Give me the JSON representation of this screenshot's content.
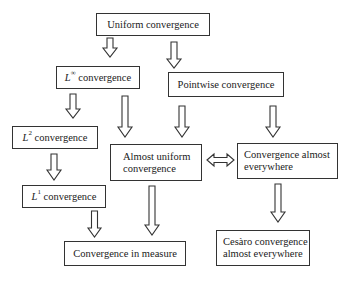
{
  "diagram": {
    "nodes": {
      "uniform": {
        "label": "Uniform convergence"
      },
      "linf": {
        "symbol": "L",
        "sup": "∞",
        "label": " convergence"
      },
      "pointwise": {
        "label": "Pointwise convergence"
      },
      "l2": {
        "symbol": "L",
        "sup": "2",
        "label": " convergence"
      },
      "almost_uniform": {
        "line1": "Almost uniform",
        "line2": "convergence"
      },
      "ae": {
        "line1": "Convergence almost",
        "line2": "everywhere"
      },
      "l1": {
        "symbol": "L",
        "sup": "1",
        "label": " convergence"
      },
      "measure": {
        "label": "Convergence in measure"
      },
      "cesaro": {
        "line1": "Cesàro convergence",
        "line2": "almost everywhere"
      }
    },
    "edges": [
      {
        "from": "uniform",
        "to": "linf",
        "type": "implies"
      },
      {
        "from": "uniform",
        "to": "pointwise",
        "type": "implies"
      },
      {
        "from": "linf",
        "to": "l2",
        "type": "implies"
      },
      {
        "from": "linf",
        "to": "almost_uniform",
        "type": "implies"
      },
      {
        "from": "pointwise",
        "to": "almost_uniform",
        "type": "implies"
      },
      {
        "from": "pointwise",
        "to": "ae",
        "type": "implies"
      },
      {
        "from": "almost_uniform",
        "to": "ae",
        "type": "equivalent"
      },
      {
        "from": "l2",
        "to": "l1",
        "type": "implies"
      },
      {
        "from": "l1",
        "to": "measure",
        "type": "implies"
      },
      {
        "from": "almost_uniform",
        "to": "measure",
        "type": "implies"
      },
      {
        "from": "ae",
        "to": "cesaro",
        "type": "implies"
      }
    ],
    "colors": {
      "stroke": "#333333",
      "fill": "#ffffff",
      "text": "#1a1a1a"
    }
  }
}
